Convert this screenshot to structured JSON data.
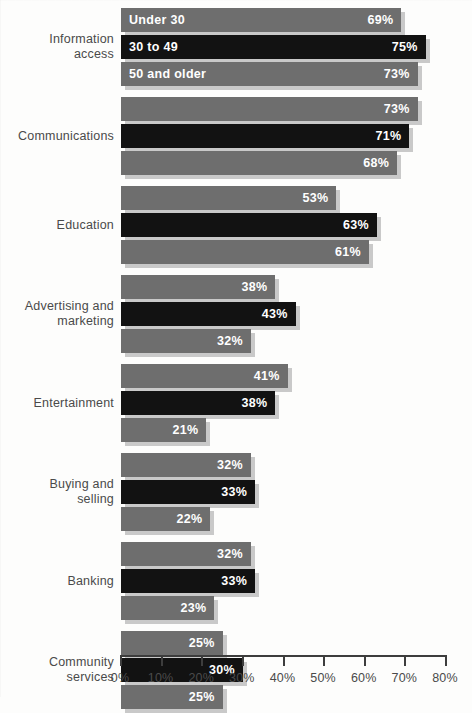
{
  "chart_data": {
    "type": "bar",
    "orientation": "horizontal",
    "title": "",
    "subtitle": "",
    "xlabel": "",
    "ylabel": "",
    "xlim": [
      0,
      80
    ],
    "grid": false,
    "legend_position": "in-bar-first-group",
    "axis": {
      "ticks": [
        0,
        10,
        20,
        30,
        40,
        50,
        60,
        70,
        80
      ],
      "tick_labels": [
        "0%",
        "10%",
        "20%",
        "30%",
        "40%",
        "50%",
        "60%",
        "70%",
        "80%"
      ]
    },
    "series": [
      {
        "name": "Under 30",
        "style": "light",
        "values": [
          69,
          73,
          53,
          38,
          41,
          32,
          32,
          25
        ]
      },
      {
        "name": "30 to 49",
        "style": "dark",
        "values": [
          75,
          71,
          63,
          43,
          38,
          33,
          33,
          30
        ]
      },
      {
        "name": "50 and older",
        "style": "light",
        "values": [
          73,
          68,
          61,
          32,
          21,
          22,
          23,
          25
        ]
      }
    ],
    "categories": [
      "Information\naccess",
      "Communications",
      "Education",
      "Advertising and\nmarketing",
      "Entertainment",
      "Buying and\nselling",
      "Banking",
      "Community\nservices"
    ],
    "value_labels": [
      [
        "69%",
        "75%",
        "73%"
      ],
      [
        "73%",
        "71%",
        "68%"
      ],
      [
        "53%",
        "63%",
        "61%"
      ],
      [
        "38%",
        "43%",
        "32%"
      ],
      [
        "41%",
        "38%",
        "21%"
      ],
      [
        "32%",
        "33%",
        "22%"
      ],
      [
        "32%",
        "33%",
        "23%"
      ],
      [
        "25%",
        "30%",
        "25%"
      ]
    ],
    "colors": {
      "light_bar": "#6e6e6e",
      "dark_bar": "#121212",
      "shadow": "#c9c9c9",
      "axis": "#3d3d3d",
      "text": "#4a4a4a",
      "bar_text": "#ffffff",
      "background": "#fdfdfc"
    }
  }
}
